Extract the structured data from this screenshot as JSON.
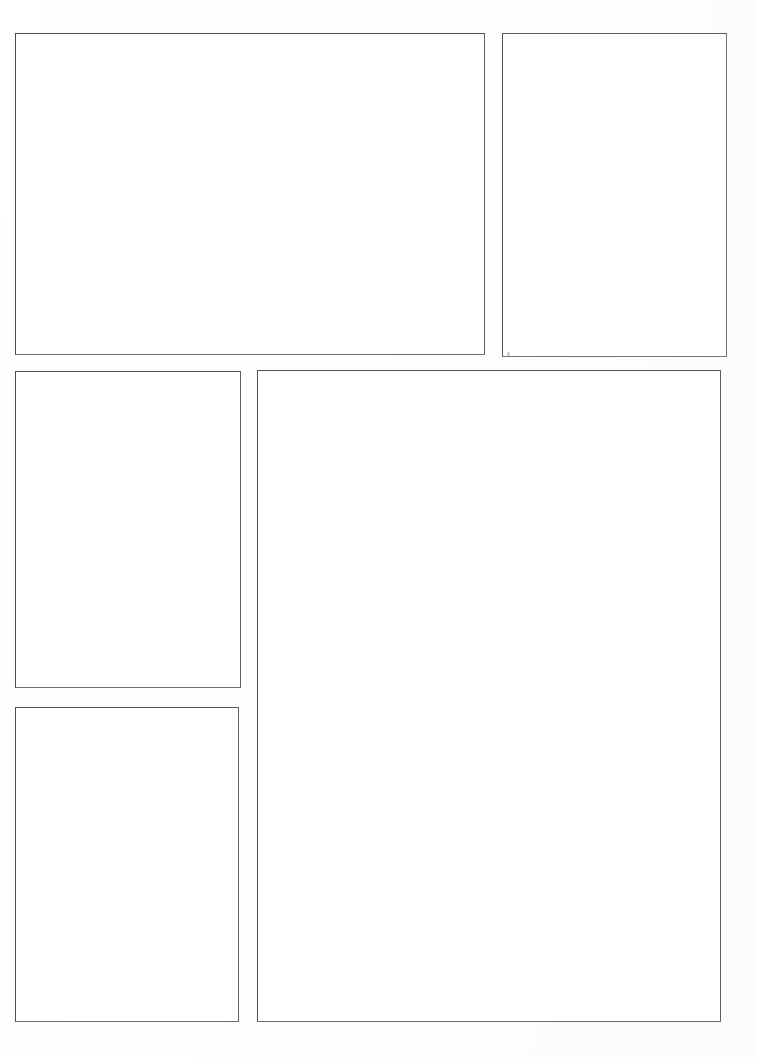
{
  "page": {
    "width": 757,
    "height": 1057,
    "background_color": "#fefefe",
    "paper_color": "#ffffff",
    "panel_border_color": "#555a5e",
    "panel_border_width": 1,
    "panel_count": 5,
    "orientation": "portrait",
    "content_text": ""
  },
  "panels": [
    {
      "id": "panel-1",
      "label": "",
      "position": "top-left",
      "shape": "rectangle",
      "x": 15,
      "y": 33,
      "width": 470,
      "height": 322,
      "fill": "#ffffff"
    },
    {
      "id": "panel-2",
      "label": "",
      "position": "top-right",
      "shape": "rectangle",
      "x": 502,
      "y": 33,
      "width": 225,
      "height": 324,
      "fill": "#ffffff"
    },
    {
      "id": "panel-3",
      "label": "",
      "position": "middle-left",
      "shape": "rectangle",
      "x": 15,
      "y": 371,
      "width": 226,
      "height": 317,
      "fill": "#ffffff"
    },
    {
      "id": "panel-4",
      "label": "",
      "position": "right-tall",
      "shape": "rectangle",
      "x": 257,
      "y": 370,
      "width": 464,
      "height": 652,
      "fill": "#ffffff"
    },
    {
      "id": "panel-5",
      "label": "",
      "position": "bottom-left",
      "shape": "rectangle",
      "x": 15,
      "y": 707,
      "width": 224,
      "height": 315,
      "fill": "#ffffff"
    }
  ],
  "marks": [
    {
      "id": "stray-mark-1",
      "description": "faint stray pencil mark near panel-2 bottom-left corner",
      "x": 507,
      "y": 352,
      "color": "#b9a99a"
    }
  ]
}
